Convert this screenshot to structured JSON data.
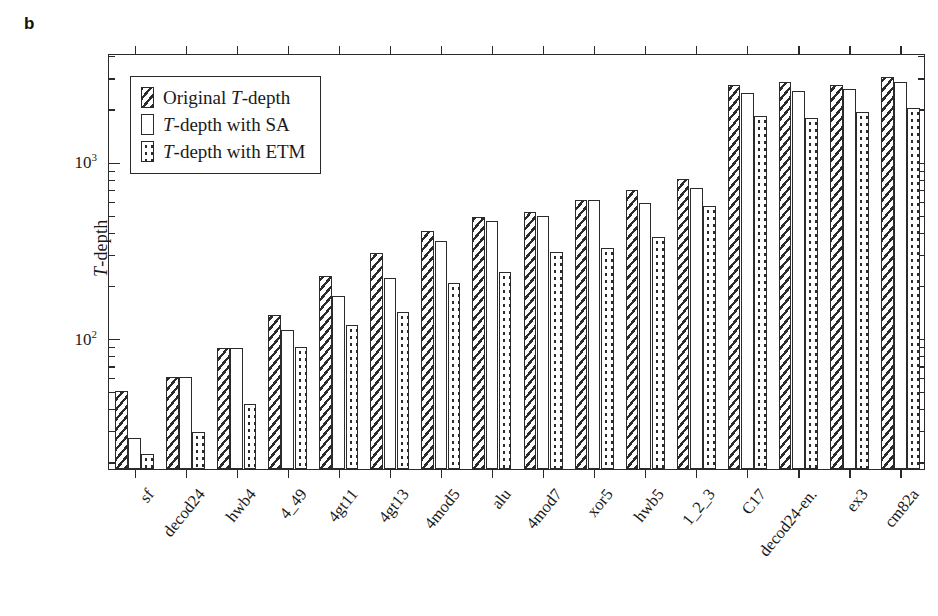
{
  "panel_label": "b",
  "chart_data": {
    "type": "bar",
    "title": "",
    "xlabel": "",
    "ylabel": "T-depth",
    "ylabel_italic_prefix": "T",
    "ylabel_rest": "-depth",
    "yscale": "log",
    "ylim": [
      18,
      4100
    ],
    "ytick_major": [
      100,
      1000
    ],
    "ytick_major_labels": [
      "10²",
      "10³"
    ],
    "grid": false,
    "legend_position": "upper left",
    "categories": [
      "sf",
      "decod24",
      "hwb4",
      "4_49",
      "4gt11",
      "4gt13",
      "4mod5",
      "alu",
      "4mod7",
      "xor5",
      "hwb5",
      "1_2_3",
      "C17",
      "decod24-en.",
      "ex3",
      "cm82a"
    ],
    "series": [
      {
        "name": "Original T-depth",
        "pattern": "hatch",
        "values": [
          50,
          60,
          87,
          134,
          224,
          300,
          400,
          480,
          515,
          600,
          690,
          790,
          2700,
          2800,
          2700,
          3000
        ]
      },
      {
        "name": "T-depth with SA",
        "pattern": "plain",
        "values": [
          27,
          60,
          87,
          110,
          172,
          218,
          355,
          455,
          490,
          600,
          580,
          700,
          2420,
          2500,
          2550,
          2800
        ]
      },
      {
        "name": "T-depth with ETM",
        "pattern": "dots",
        "values": [
          22,
          29,
          42,
          88,
          118,
          140,
          205,
          235,
          305,
          320,
          370,
          555,
          1800,
          1750,
          1900,
          2000
        ]
      }
    ],
    "legend": [
      {
        "label_italic": "T",
        "label_pre": "Original ",
        "label_post": "-depth",
        "pattern": "hatch"
      },
      {
        "label_italic": "T",
        "label_pre": "",
        "label_post": "-depth with SA",
        "pattern": "plain"
      },
      {
        "label_italic": "T",
        "label_pre": "",
        "label_post": "-depth with ETM",
        "pattern": "dots"
      }
    ]
  }
}
